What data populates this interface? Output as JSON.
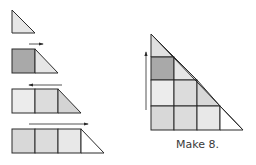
{
  "caption": "Make 8.",
  "colors": {
    "stroke": "#2a2a2a",
    "light": "#e9e9e9",
    "mid": "#d8d8d8",
    "dark": "#a9a9a9",
    "white": "#ffffff"
  },
  "steps": [
    {
      "squares": 0,
      "arrow": "none"
    },
    {
      "squares": 1,
      "arrow": "right"
    },
    {
      "squares": 2,
      "arrow": "left"
    },
    {
      "squares": 3,
      "arrow": "right"
    }
  ],
  "result": {
    "rows": 4,
    "arrow": "up",
    "label": "Make 8."
  }
}
